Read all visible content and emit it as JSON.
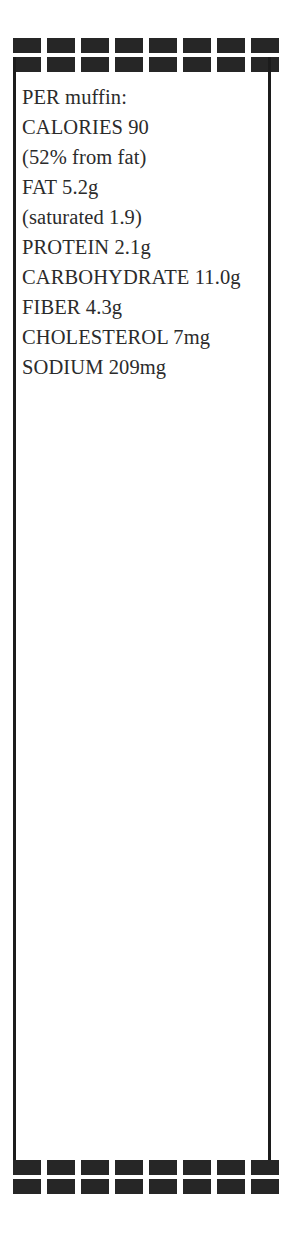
{
  "page": {
    "background_color": "#ffffff",
    "ink_color": "#2b2b2b",
    "dash_color": "#262626",
    "rule_color": "#1c1c1c",
    "width": 299,
    "height": 1247
  },
  "border": {
    "style": "dashed-double-row",
    "dashes_per_row": 8,
    "rows_per_band": 2,
    "bands": [
      "top",
      "bottom"
    ]
  },
  "nutrition": {
    "heading": "PER muffin:",
    "lines": [
      "PER muffin:",
      "CALORIES 90",
      "(52% from fat)",
      "FAT 5.2g",
      "(saturated 1.9)",
      "PROTEIN 2.1g",
      "CARBOHYDRATE 11.0g",
      "FIBER 4.3g",
      "CHOLESTEROL 7mg",
      "SODIUM 209mg"
    ],
    "facts": [
      {
        "label": "CALORIES",
        "value": "90"
      },
      {
        "label": "from fat",
        "value": "52%"
      },
      {
        "label": "FAT",
        "value": "5.2g"
      },
      {
        "label": "saturated",
        "value": "1.9"
      },
      {
        "label": "PROTEIN",
        "value": "2.1g"
      },
      {
        "label": "CARBOHYDRATE",
        "value": "11.0g"
      },
      {
        "label": "FIBER",
        "value": "4.3g"
      },
      {
        "label": "CHOLESTEROL",
        "value": "7mg"
      },
      {
        "label": "SODIUM",
        "value": "209mg"
      }
    ]
  }
}
